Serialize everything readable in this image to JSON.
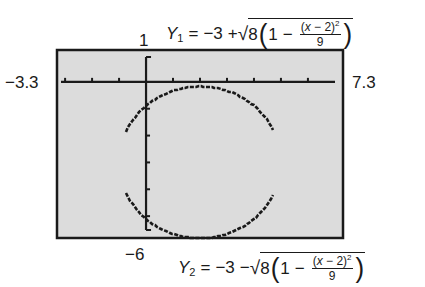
{
  "chart_data": {
    "type": "line",
    "title": "",
    "window": {
      "xmin": -3.3,
      "xmax": 7.3,
      "ymin": -6,
      "ymax": 1
    },
    "xlim": [
      -3.3,
      7.3
    ],
    "ylim": [
      -6,
      1
    ],
    "grid": false,
    "xscl": 1,
    "yscl": 1,
    "series": [
      {
        "name": "Y1",
        "equation": "Y1 = -3 + sqrt(8(1 - (x-2)^2/9))",
        "half": "upper",
        "center": [
          2,
          -3
        ],
        "a": 3,
        "b": 2.828
      },
      {
        "name": "Y2",
        "equation": "Y2 = -3 - sqrt(8(1 - (x-2)^2/9))",
        "half": "lower",
        "center": [
          2,
          -3
        ],
        "a": 3,
        "b": 2.828
      }
    ],
    "xlabel": "",
    "ylabel": ""
  },
  "labels": {
    "xmin": "−3.3",
    "xmax": "7.3",
    "ymax": "1",
    "ymin": "−6"
  },
  "equations": {
    "y1": {
      "name": "Y",
      "sub": "1",
      "eq": "=",
      "const": "−3",
      "sign": "+",
      "sqrt": "√",
      "coef": "8",
      "one": "1",
      "minus": "−",
      "num_open": "(",
      "num_var": "x",
      "num_rest": " − 2)",
      "num_exp": "2",
      "den": "9"
    },
    "y2": {
      "name": "Y",
      "sub": "2",
      "eq": "=",
      "const": "−3",
      "sign": "−",
      "sqrt": "√",
      "coef": "8",
      "one": "1",
      "minus": "−",
      "num_open": "(",
      "num_var": "x",
      "num_rest": " − 2)",
      "num_exp": "2",
      "den": "9"
    }
  },
  "colors": {
    "screen_bg": "#dcdcdc",
    "ink": "#1a1a1a",
    "page_bg": "#ffffff"
  }
}
